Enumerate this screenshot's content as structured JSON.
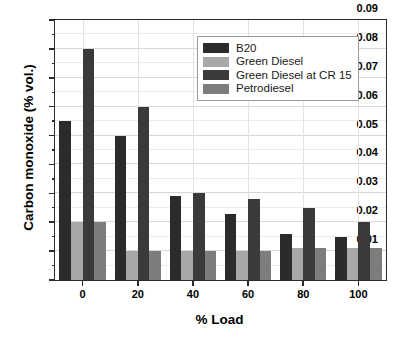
{
  "chart_data": {
    "type": "bar",
    "title": "",
    "xlabel": "% Load",
    "ylabel": "Carbon monoxide (% vol.)",
    "categories": [
      "0",
      "20",
      "40",
      "60",
      "80",
      "100"
    ],
    "series": [
      {
        "name": "B20",
        "color": "#2b2b2b",
        "values": [
          0.055,
          0.05,
          0.029,
          0.023,
          0.016,
          0.015
        ]
      },
      {
        "name": "Green Diesel",
        "color": "#a8a8a8",
        "values": [
          0.02,
          0.01,
          0.01,
          0.01,
          0.011,
          0.011
        ]
      },
      {
        "name": "Green Diesel at CR 15",
        "color": "#3a3a3a",
        "values": [
          0.08,
          0.06,
          0.03,
          0.028,
          0.025,
          0.02
        ]
      },
      {
        "name": "Petrodiesel",
        "color": "#7d7d7d",
        "values": [
          0.02,
          0.01,
          0.01,
          0.01,
          0.011,
          0.011
        ]
      }
    ],
    "ylim": [
      0.0,
      0.09
    ],
    "ytick_labels": [
      "0.00",
      "0.01",
      "0.02",
      "0.03",
      "0.04",
      "0.05",
      "0.06",
      "0.07",
      "0.08",
      "0.09"
    ],
    "ytick_values": [
      0.0,
      0.01,
      0.02,
      0.03,
      0.04,
      0.05,
      0.06,
      0.07,
      0.08,
      0.09
    ],
    "xtick_labels": [
      "0",
      "20",
      "40",
      "60",
      "80",
      "100"
    ],
    "grid": true,
    "minor_tick_step": 0.005,
    "legend_position": "top-right"
  }
}
